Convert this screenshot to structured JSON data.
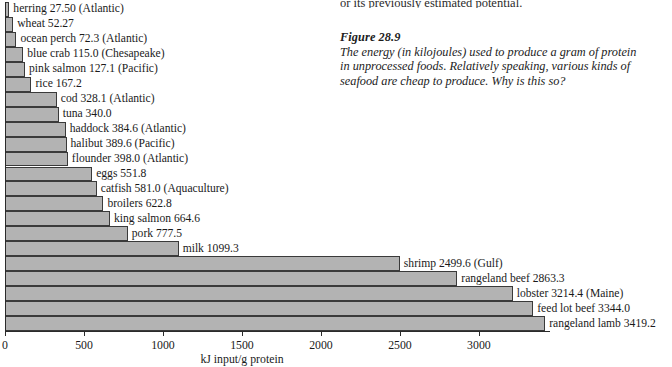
{
  "body_text": {
    "tail_line": "or its previously estimated potential."
  },
  "caption": {
    "figure_number": "Figure 28.9",
    "text": "The energy (in kilojoules) used to produce a gram of protein in unprocessed foods. Relatively speaking, various kinds of seafood are cheap to produce. Why is this so?"
  },
  "chart_data": {
    "type": "bar",
    "orientation": "horizontal",
    "title": "",
    "xlabel": "kJ input/g protein",
    "ylabel": "",
    "xlim": [
      0,
      3450
    ],
    "xticks": [
      0,
      500,
      1000,
      1500,
      2000,
      2500,
      3000
    ],
    "xtick_labels": [
      "0",
      "500",
      "1000",
      "1500",
      "2000",
      "2500",
      "3000"
    ],
    "grid": false,
    "legend": "none",
    "bar_color": "#b3b3b3",
    "bar_edge_color": "#3a3a3a",
    "categories": [
      "herring",
      "wheat",
      "ocean perch",
      "blue crab",
      "pink salmon",
      "rice",
      "cod",
      "tuna",
      "haddock",
      "halibut",
      "flounder",
      "eggs",
      "catfish",
      "broilers",
      "king salmon",
      "pork",
      "milk",
      "shrimp",
      "rangeland beef",
      "lobster",
      "feed lot beef",
      "rangeland lamb"
    ],
    "values": [
      27.5,
      52.27,
      72.3,
      115.0,
      127.1,
      167.2,
      328.1,
      340.0,
      384.6,
      389.6,
      398.0,
      551.8,
      581.0,
      622.8,
      664.6,
      777.5,
      1099.3,
      2499.6,
      2863.3,
      3214.4,
      3344.0,
      3419.2
    ],
    "bar_labels": [
      "herring 27.50 (Atlantic)",
      "wheat 52.27",
      "ocean perch 72.3 (Atlantic)",
      "blue crab 115.0 (Chesapeake)",
      "pink salmon 127.1 (Pacific)",
      "rice 167.2",
      "cod 328.1 (Atlantic)",
      "tuna 340.0",
      "haddock 384.6 (Atlantic)",
      "halibut 389.6 (Pacific)",
      "flounder 398.0 (Atlantic)",
      "eggs 551.8",
      "catfish 581.0 (Aquaculture)",
      "broilers 622.8",
      "king salmon 664.6",
      "pork 777.5",
      "milk 1099.3",
      "shrimp 2499.6 (Gulf)",
      "rangeland beef 2863.3",
      "lobster 3214.4 (Maine)",
      "feed lot beef 3344.0",
      "rangeland lamb 3419.2"
    ]
  }
}
